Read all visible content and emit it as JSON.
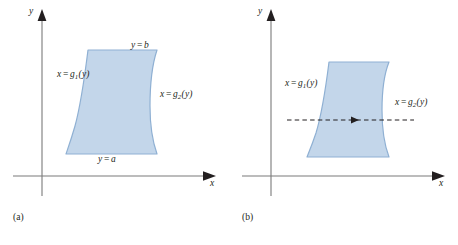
{
  "figure": {
    "colors": {
      "region_fill": "#c3d6ea",
      "region_stroke": "#8fb0d3",
      "axis": "#6f6f6f",
      "arrow_dark": "#231f20",
      "text": "#231f20",
      "background": "#ffffff"
    },
    "panels": [
      {
        "id": "a",
        "caption": "(a)",
        "axes": {
          "x_label": "x",
          "y_label": "y"
        },
        "region": {
          "description": "type-II region bounded left by x = g1(y), right by x = g2(y), below by y = a, above by y = b"
        },
        "labels": [
          {
            "name": "top-boundary-label",
            "lhs": "y",
            "op": "=",
            "rhs": "b",
            "sub": ""
          },
          {
            "name": "bottom-boundary-label",
            "lhs": "y",
            "op": "=",
            "rhs": "a",
            "sub": ""
          },
          {
            "name": "left-boundary-label",
            "lhs": "x",
            "op": "=",
            "rhs": "g",
            "sub": "1",
            "arg": "(y)"
          },
          {
            "name": "right-boundary-label",
            "lhs": "x",
            "op": "=",
            "rhs": "g",
            "sub": "2",
            "arg": "(y)"
          }
        ],
        "has_horizontal_scan_arrow": false
      },
      {
        "id": "b",
        "caption": "(b)",
        "axes": {
          "x_label": "x",
          "y_label": "y"
        },
        "region": {
          "description": "same type-II region with a horizontal dashed scan line crossing it from left to right"
        },
        "labels": [
          {
            "name": "left-boundary-label",
            "lhs": "x",
            "op": "=",
            "rhs": "g",
            "sub": "1",
            "arg": "(y)"
          },
          {
            "name": "right-boundary-label",
            "lhs": "x",
            "op": "=",
            "rhs": "g",
            "sub": "2",
            "arg": "(y)"
          }
        ],
        "has_horizontal_scan_arrow": true
      }
    ]
  }
}
